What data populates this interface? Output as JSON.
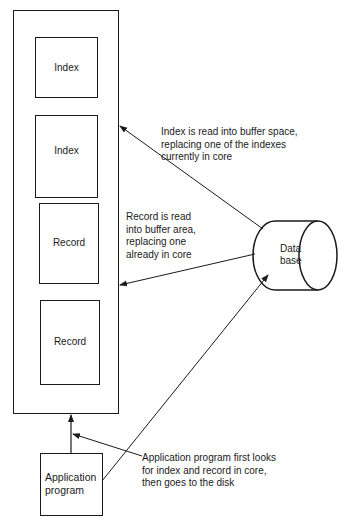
{
  "diagram": {
    "buffer_container": {
      "blocks": [
        {
          "label": "Index"
        },
        {
          "label": "Index"
        },
        {
          "label": "Record"
        },
        {
          "label": "Record"
        }
      ]
    },
    "application": {
      "label": "Application\nprogram"
    },
    "database": {
      "label": "Data\nbase"
    },
    "annotations": {
      "index_read": "Index is read into buffer space,\nreplacing one of the indexes\ncurrently in core",
      "record_read": "Record is read\ninto buffer area,\nreplacing one\nalready in core",
      "app_lookup": "Application program first looks\nfor index and record in core,\nthen goes to the disk"
    },
    "colors": {
      "ink": "#1a1a1a",
      "background": "#ffffff"
    }
  }
}
